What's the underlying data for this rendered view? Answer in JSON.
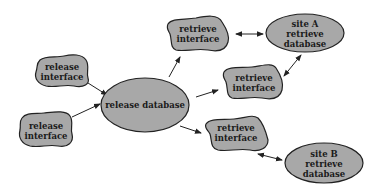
{
  "diagram": {
    "nodes": [
      {
        "id": "release_if_1",
        "type": "interface",
        "lines": [
          "release",
          "interface"
        ]
      },
      {
        "id": "release_if_2",
        "type": "interface",
        "lines": [
          "release",
          "interface"
        ]
      },
      {
        "id": "release_db",
        "type": "database",
        "lines": [
          "release database"
        ]
      },
      {
        "id": "retrieve_if_top",
        "type": "interface",
        "lines": [
          "retrieve",
          "interface"
        ]
      },
      {
        "id": "retrieve_if_mid",
        "type": "interface",
        "lines": [
          "retrieve",
          "interface"
        ]
      },
      {
        "id": "retrieve_if_bot",
        "type": "interface",
        "lines": [
          "retrieve",
          "interface"
        ]
      },
      {
        "id": "site_a_db",
        "type": "database",
        "lines": [
          "site A",
          "retrieve",
          "database"
        ]
      },
      {
        "id": "site_b_db",
        "type": "database",
        "lines": [
          "site B",
          "retrieve",
          "database"
        ]
      }
    ],
    "edges": [
      {
        "from": "release_if_1",
        "to": "release_db",
        "direction": "forward"
      },
      {
        "from": "release_if_2",
        "to": "release_db",
        "direction": "forward"
      },
      {
        "from": "release_db",
        "to": "retrieve_if_top",
        "direction": "forward"
      },
      {
        "from": "release_db",
        "to": "retrieve_if_mid",
        "direction": "forward"
      },
      {
        "from": "release_db",
        "to": "retrieve_if_bot",
        "direction": "forward"
      },
      {
        "from": "retrieve_if_top",
        "to": "site_a_db",
        "direction": "both"
      },
      {
        "from": "retrieve_if_mid",
        "to": "site_a_db",
        "direction": "both"
      },
      {
        "from": "retrieve_if_bot",
        "to": "site_b_db",
        "direction": "both"
      }
    ],
    "colors": {
      "fill": "#a8a8a8",
      "stroke": "#222222",
      "background": "#ffffff"
    }
  }
}
